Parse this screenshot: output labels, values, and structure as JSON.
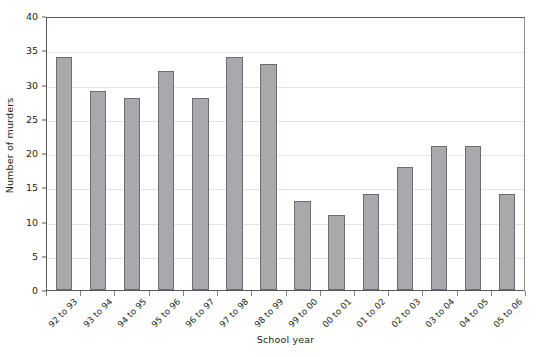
{
  "chart_data": {
    "type": "bar",
    "title": "",
    "subtitle": "",
    "xlabel": "School year",
    "ylabel": "Number of murders",
    "categories": [
      "92 to 93",
      "93 to 94",
      "94 to 95",
      "95 to 96",
      "96 to 97",
      "97 to 98",
      "98 to 99",
      "99 to 00",
      "00 to 01",
      "01 to 02",
      "02 to 03",
      "03 to 04",
      "04 to 05",
      "05 to 06"
    ],
    "values": [
      34,
      29,
      28,
      32,
      28,
      34,
      33,
      13,
      11,
      14,
      18,
      21,
      21,
      14
    ],
    "ylim": [
      0,
      40
    ],
    "ytick_labels": [
      "0",
      "5",
      "10",
      "15",
      "20",
      "25",
      "30",
      "35",
      "40"
    ],
    "ytick_values": [
      0,
      5,
      10,
      15,
      20,
      25,
      30,
      35,
      40
    ],
    "grid": "horizontal",
    "legend": "none",
    "annotations": [],
    "colors": {
      "bar_fill": "#a7a9ac",
      "bar_border": "#6d6e71",
      "gridline": "#e3e3e3",
      "axis": "#58595b",
      "text": "#231f20",
      "background": "#ffffff"
    }
  }
}
